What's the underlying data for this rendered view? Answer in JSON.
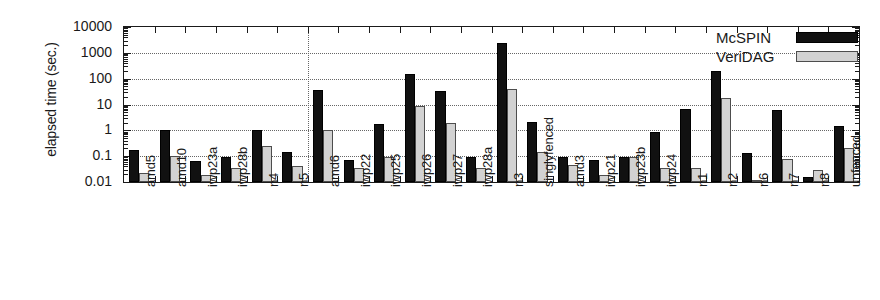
{
  "chart_data": {
    "type": "bar",
    "title": "",
    "xlabel": "",
    "ylabel": "elapsed time (sec.)",
    "yscale": "log",
    "ylim": [
      0.01,
      10000
    ],
    "ytick_labels": [
      "0.01",
      "0.1",
      "1",
      "10",
      "100",
      "1000",
      "10000"
    ],
    "ytick_values": [
      0.01,
      0.1,
      1,
      10,
      100,
      1000,
      10000
    ],
    "grid": "horizontal-dotted",
    "legend_position": "top-right",
    "separator_after_category": "n5",
    "categories": [
      "amd5",
      "amd10",
      "iwp23a",
      "iwp28b",
      "n4",
      "n5",
      "amd6",
      "iwp22",
      "iwp25",
      "iwp26",
      "iwp27",
      "iwp28a",
      "n3",
      "singlyfenced",
      "amd3",
      "iwp21",
      "iwp23b",
      "iwp24",
      "n1",
      "n2",
      "n6",
      "n7",
      "n8",
      "unfenced"
    ],
    "series": [
      {
        "name": "McSPIN",
        "color": "#111111",
        "values": [
          0.17,
          1.0,
          0.065,
          0.09,
          1.0,
          0.14,
          35,
          0.07,
          1.8,
          150,
          33,
          0.09,
          2500,
          2.2,
          0.09,
          0.07,
          0.09,
          0.9,
          7.0,
          200,
          0.13,
          6.0,
          0.016,
          1.5
        ]
      },
      {
        "name": "VeriDAG",
        "color": "#d2d2d2",
        "values": [
          0.022,
          0.1,
          0.018,
          0.035,
          0.25,
          0.04,
          1.0,
          0.035,
          0.09,
          9.0,
          2.0,
          0.035,
          40,
          0.15,
          0.045,
          0.018,
          0.09,
          0.035,
          0.035,
          18,
          0.012,
          0.08,
          0.03,
          0.2
        ]
      }
    ]
  },
  "legend": {
    "items": [
      {
        "label": "McSPIN"
      },
      {
        "label": "VeriDAG"
      }
    ]
  }
}
